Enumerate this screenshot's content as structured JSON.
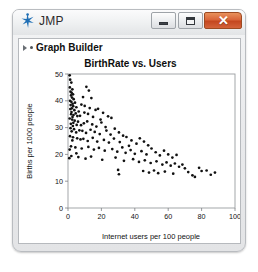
{
  "window": {
    "app_title": "JMP",
    "logo_icon": "jmp-star-icon",
    "controls": {
      "minimize_label": "–",
      "minimize_icon": "minimize-icon",
      "maximize_label": "□",
      "maximize_icon": "maximize-icon",
      "close_label": "✕",
      "close_icon": "close-icon"
    },
    "colors": {
      "titlebar_top": "#fbfbfc",
      "titlebar_bottom": "#e2e4e6",
      "close_button": "#c4471f",
      "border": "#b9bcc0",
      "panel_background": "#ffffff",
      "point_color": "#111111"
    }
  },
  "report": {
    "header_label": "Graph Builder",
    "disclosure_icon": "disclosure-triangle-icon",
    "bullet_icon": "bullet-icon"
  },
  "chart_data": {
    "type": "scatter",
    "title": "BirthRate vs. Users",
    "xlabel": "Internet users per 100 people",
    "ylabel": "Births per 1000 people",
    "xlim": [
      0,
      100
    ],
    "ylim": [
      0,
      50
    ],
    "xticks": [
      0,
      20,
      40,
      60,
      80,
      100
    ],
    "yticks": [
      0,
      10,
      20,
      30,
      40,
      50
    ],
    "grid": false,
    "legend": null,
    "marker": "filled-circle",
    "marker_color": "#111111",
    "points": [
      [
        1.0,
        49.5
      ],
      [
        1.3,
        47.9
      ],
      [
        2.0,
        46.8
      ],
      [
        1.1,
        45.0
      ],
      [
        2.6,
        44.3
      ],
      [
        1.5,
        43.4
      ],
      [
        2.2,
        43.0
      ],
      [
        3.0,
        42.4
      ],
      [
        1.8,
        42.0
      ],
      [
        11.0,
        45.2
      ],
      [
        12.5,
        43.8
      ],
      [
        9.0,
        41.4
      ],
      [
        14.0,
        41.0
      ],
      [
        2.4,
        41.2
      ],
      [
        3.4,
        40.6
      ],
      [
        1.2,
        40.0
      ],
      [
        2.0,
        39.6
      ],
      [
        4.2,
        39.3
      ],
      [
        2.8,
        38.9
      ],
      [
        1.6,
        38.4
      ],
      [
        3.1,
        38.0
      ],
      [
        5.0,
        37.6
      ],
      [
        2.3,
        37.2
      ],
      [
        1.4,
        36.9
      ],
      [
        3.8,
        36.5
      ],
      [
        6.4,
        36.0
      ],
      [
        2.1,
        35.8
      ],
      [
        4.6,
        35.3
      ],
      [
        1.9,
        35.0
      ],
      [
        3.3,
        34.7
      ],
      [
        5.6,
        34.3
      ],
      [
        2.7,
        34.0
      ],
      [
        8.0,
        38.6
      ],
      [
        10.0,
        38.1
      ],
      [
        13.0,
        37.3
      ],
      [
        16.5,
        36.6
      ],
      [
        9.8,
        35.6
      ],
      [
        12.0,
        35.1
      ],
      [
        7.2,
        34.4
      ],
      [
        15.0,
        34.0
      ],
      [
        18.0,
        37.0
      ],
      [
        21.0,
        35.5
      ],
      [
        24.0,
        34.2
      ],
      [
        19.5,
        33.0
      ],
      [
        26.0,
        33.6
      ],
      [
        1.0,
        33.4
      ],
      [
        2.5,
        33.0
      ],
      [
        4.0,
        32.6
      ],
      [
        6.0,
        32.2
      ],
      [
        3.2,
        31.8
      ],
      [
        1.7,
        31.4
      ],
      [
        5.2,
        31.0
      ],
      [
        2.9,
        30.6
      ],
      [
        7.8,
        30.9
      ],
      [
        9.5,
        31.6
      ],
      [
        11.5,
        32.3
      ],
      [
        14.5,
        31.2
      ],
      [
        17.0,
        30.4
      ],
      [
        20.0,
        31.9
      ],
      [
        22.5,
        30.2
      ],
      [
        1.5,
        29.8
      ],
      [
        3.6,
        29.4
      ],
      [
        6.8,
        29.0
      ],
      [
        2.2,
        28.6
      ],
      [
        4.9,
        28.2
      ],
      [
        8.6,
        28.8
      ],
      [
        10.8,
        28.0
      ],
      [
        13.5,
        29.2
      ],
      [
        16.0,
        28.4
      ],
      [
        19.0,
        27.6
      ],
      [
        23.0,
        28.9
      ],
      [
        25.5,
        27.4
      ],
      [
        28.0,
        29.6
      ],
      [
        30.5,
        28.2
      ],
      [
        33.0,
        27.0
      ],
      [
        1.2,
        26.8
      ],
      [
        3.0,
        26.4
      ],
      [
        5.5,
        26.0
      ],
      [
        7.5,
        25.6
      ],
      [
        2.6,
        25.2
      ],
      [
        9.2,
        25.8
      ],
      [
        11.8,
        25.0
      ],
      [
        14.8,
        26.2
      ],
      [
        17.5,
        24.8
      ],
      [
        21.5,
        25.4
      ],
      [
        24.5,
        24.4
      ],
      [
        27.5,
        25.9
      ],
      [
        31.0,
        24.6
      ],
      [
        35.0,
        26.5
      ],
      [
        38.0,
        25.2
      ],
      [
        41.0,
        24.0
      ],
      [
        36.5,
        23.2
      ],
      [
        43.0,
        26.0
      ],
      [
        45.5,
        24.8
      ],
      [
        48.0,
        23.4
      ],
      [
        1.8,
        23.0
      ],
      [
        4.4,
        22.6
      ],
      [
        8.2,
        22.2
      ],
      [
        12.2,
        22.8
      ],
      [
        15.5,
        21.8
      ],
      [
        18.5,
        22.4
      ],
      [
        22.0,
        21.4
      ],
      [
        26.5,
        22.0
      ],
      [
        29.5,
        21.0
      ],
      [
        32.5,
        22.6
      ],
      [
        34.5,
        20.6
      ],
      [
        37.5,
        21.6
      ],
      [
        40.0,
        20.2
      ],
      [
        44.0,
        21.2
      ],
      [
        47.0,
        20.0
      ],
      [
        50.0,
        22.2
      ],
      [
        52.5,
        20.8
      ],
      [
        55.0,
        19.6
      ],
      [
        57.5,
        21.4
      ],
      [
        60.0,
        20.0
      ],
      [
        62.5,
        18.8
      ],
      [
        65.0,
        19.8
      ],
      [
        2.0,
        19.4
      ],
      [
        0.8,
        18.6
      ],
      [
        6.2,
        19.0
      ],
      [
        10.5,
        18.4
      ],
      [
        13.8,
        19.2
      ],
      [
        20.5,
        18.0
      ],
      [
        28.5,
        18.8
      ],
      [
        33.5,
        17.6
      ],
      [
        39.0,
        18.2
      ],
      [
        42.5,
        17.2
      ],
      [
        46.0,
        17.8
      ],
      [
        49.5,
        16.8
      ],
      [
        53.0,
        17.4
      ],
      [
        56.5,
        16.2
      ],
      [
        59.0,
        17.0
      ],
      [
        61.5,
        15.8
      ],
      [
        64.0,
        16.6
      ],
      [
        66.5,
        15.4
      ],
      [
        68.5,
        16.2
      ],
      [
        70.0,
        14.8
      ],
      [
        30.0,
        14.2
      ],
      [
        30.5,
        12.6
      ],
      [
        45.0,
        13.8
      ],
      [
        48.5,
        13.2
      ],
      [
        51.5,
        14.0
      ],
      [
        54.0,
        13.0
      ],
      [
        58.0,
        13.6
      ],
      [
        63.0,
        12.8
      ],
      [
        72.0,
        13.4
      ],
      [
        74.5,
        12.2
      ],
      [
        83.0,
        14.0
      ],
      [
        85.5,
        12.4
      ],
      [
        88.0,
        13.2
      ],
      [
        76.0,
        11.6
      ],
      [
        78.5,
        15.0
      ],
      [
        80.0,
        13.8
      ],
      [
        5.0,
        20.4
      ],
      [
        1.0,
        21.8
      ]
    ]
  }
}
